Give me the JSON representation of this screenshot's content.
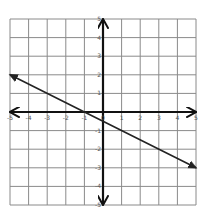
{
  "chart_data": {
    "type": "line",
    "title": "",
    "xlabel": "",
    "ylabel": "",
    "xlim": [
      -5,
      5
    ],
    "ylim": [
      -5,
      5
    ],
    "grid": true,
    "x_ticks": [
      -5,
      -4,
      -3,
      -2,
      -1,
      0,
      1,
      2,
      3,
      4,
      5
    ],
    "y_ticks": [
      -5,
      -4,
      -3,
      -2,
      -1,
      0,
      1,
      2,
      3,
      4,
      5
    ],
    "series": [
      {
        "name": "line",
        "equation": "y = -0.5x - 0.5",
        "slope": -0.5,
        "y_intercept": -0.5,
        "x_intercept": -1,
        "x": [
          -5,
          -1,
          0,
          5
        ],
        "y": [
          2,
          0,
          -0.5,
          -3
        ],
        "arrows": "both"
      }
    ],
    "colors": {
      "grid": "#8a8a8a",
      "axis": "#111111",
      "line": "#222222"
    }
  }
}
